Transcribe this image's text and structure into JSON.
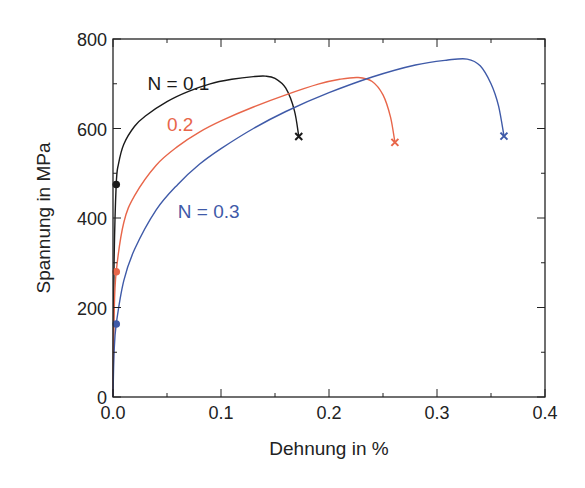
{
  "chart_data": {
    "type": "line",
    "title": "",
    "xlabel": "Dehnung in %",
    "ylabel": "Spannung in MPa",
    "xlim": [
      0.0,
      0.4
    ],
    "ylim": [
      0,
      800
    ],
    "x_ticks": [
      "0.0",
      "0.1",
      "0.2",
      "0.3",
      "0.4"
    ],
    "y_ticks": [
      "0",
      "200",
      "400",
      "600",
      "800"
    ],
    "grid": false,
    "legend": "inline labels",
    "series": [
      {
        "name": "N = 0.1",
        "label": "N = 0.1",
        "color": "#1a1a1a",
        "x": [
          0.0,
          0.001,
          0.003,
          0.005,
          0.01,
          0.02,
          0.03,
          0.05,
          0.07,
          0.09,
          0.11,
          0.13,
          0.141,
          0.15,
          0.16,
          0.168,
          0.172
        ],
        "y": [
          0,
          300,
          475,
          520,
          565,
          605,
          628,
          660,
          683,
          700,
          710,
          716,
          717,
          712,
          690,
          640,
          582
        ],
        "yield_point": [
          0.003,
          475
        ],
        "fracture_point": [
          0.172,
          582
        ]
      },
      {
        "name": "0.2",
        "label": "0.2",
        "color": "#e8664a",
        "x": [
          0.0,
          0.001,
          0.003,
          0.01,
          0.02,
          0.04,
          0.06,
          0.08,
          0.1,
          0.13,
          0.16,
          0.19,
          0.21,
          0.227,
          0.24,
          0.25,
          0.257,
          0.261
        ],
        "y": [
          0,
          180,
          280,
          390,
          450,
          518,
          560,
          592,
          617,
          648,
          675,
          699,
          710,
          714,
          705,
          675,
          625,
          569
        ],
        "yield_point": [
          0.003,
          280
        ],
        "fracture_point": [
          0.261,
          569
        ]
      },
      {
        "name": "N = 0.3",
        "label": "N = 0.3",
        "color": "#3f5aa8",
        "x": [
          0.0,
          0.001,
          0.003,
          0.01,
          0.02,
          0.04,
          0.06,
          0.08,
          0.1,
          0.13,
          0.16,
          0.2,
          0.24,
          0.28,
          0.31,
          0.328,
          0.34,
          0.35,
          0.357,
          0.362
        ],
        "y": [
          0,
          100,
          163,
          260,
          330,
          418,
          475,
          520,
          555,
          600,
          638,
          680,
          715,
          742,
          753,
          755,
          740,
          700,
          650,
          583
        ],
        "yield_point": [
          0.003,
          163
        ],
        "fracture_point": [
          0.362,
          583
        ]
      }
    ],
    "annotations": [
      {
        "text": "N = 0.1",
        "x": 0.032,
        "y": 685,
        "color": "#1a1a1a"
      },
      {
        "text": "0.2",
        "x": 0.05,
        "y": 595,
        "color": "#e8664a"
      },
      {
        "text": "N = 0.3",
        "x": 0.06,
        "y": 400,
        "color": "#3f5aa8"
      }
    ]
  }
}
